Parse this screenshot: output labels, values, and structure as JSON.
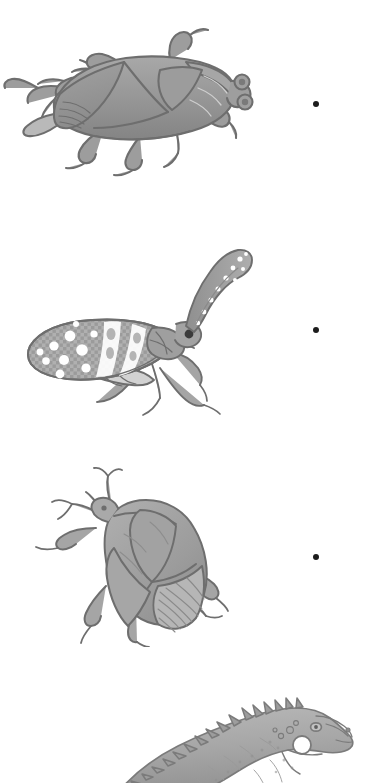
{
  "page": {
    "background_color": "#ffffff",
    "width": 375,
    "height": 783
  },
  "style": {
    "ink_color": "#6e6e6e",
    "ink_dark": "#4a4a4a",
    "fill_light": "#b3b3b3",
    "fill_mid": "#9a9a9a",
    "fill_dark": "#7f7f7f",
    "highlight": "#ffffff",
    "dot_color": "#1c1c1c"
  },
  "items": [
    {
      "id": "waterbug",
      "label": "Giant water bug",
      "icon": "insect-true-bug-icon",
      "description": "Top-down pencil drawing of a broad oval true bug with folded wings, six legs and two bulging eyes, facing right",
      "orientation": "horizontal, head to the right"
    },
    {
      "id": "lanternfly",
      "label": "Lanternfly",
      "icon": "insect-lanternfly-icon",
      "description": "Side view pencil drawing of a lanternfly with a long upward curving spotted snout and a broad speckled forewing",
      "orientation": "side profile, snout curving up and right"
    },
    {
      "id": "shieldbug",
      "label": "Shield bug",
      "icon": "insect-shield-bug-icon",
      "description": "Pencil drawing of a shield or stink bug seen from above, tilted diagonally with antennae at upper left and fanned hind wing at lower right",
      "orientation": "diagonal, head toward upper left"
    },
    {
      "id": "iguana",
      "label": "Green iguana",
      "icon": "reptile-iguana-icon",
      "description": "Pencil drawing of an iguana head and shoulders with a row of dorsal spines, a dewlap and a large round subtympanic scale, facing right",
      "orientation": "side profile, head to the right, cropped by the bottom of the page"
    }
  ],
  "connectors": [
    {
      "id": "dot-1",
      "name": "match-dot-waterbug",
      "shape": "dot",
      "x": 316,
      "y": 104
    },
    {
      "id": "dot-2",
      "name": "match-dot-lanternfly",
      "shape": "dot",
      "x": 316,
      "y": 330
    },
    {
      "id": "dot-3",
      "name": "match-dot-shieldbug",
      "shape": "dot",
      "x": 316,
      "y": 557
    }
  ]
}
